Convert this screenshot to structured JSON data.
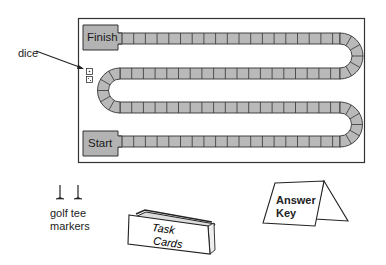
{
  "figure": {
    "type": "board-game-layout",
    "board": {
      "finish_label": "Finish",
      "start_label": "Start",
      "track_rows": 4,
      "fill_color": "#b8b8b8",
      "stroke_color": "#333333"
    },
    "callouts": {
      "dice": "dice"
    },
    "items": {
      "golf_tee_markers": {
        "line1": "golf tee",
        "line2": "markers"
      },
      "task_cards": {
        "line1": "Task",
        "line2": "Cards"
      },
      "answer_key": {
        "line1": "Answer",
        "line2": "Key"
      }
    }
  }
}
